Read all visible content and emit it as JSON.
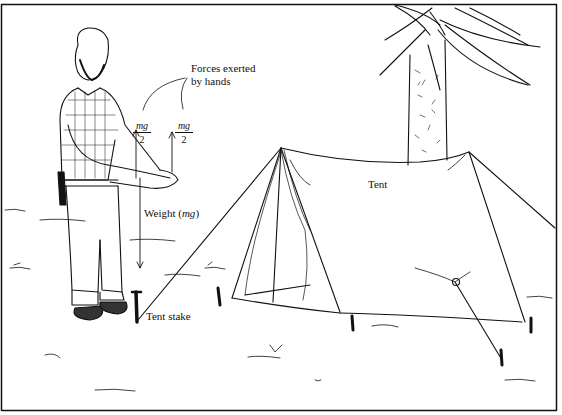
{
  "labels": {
    "forces_line1": "Forces exerted",
    "forces_line2": "by hands",
    "weight_prefix": "Weight (",
    "weight_symbol": "mg",
    "weight_suffix": ")",
    "tent_stake": "Tent stake",
    "tent": "Tent"
  },
  "fractions": [
    {
      "numerator": "mg",
      "denominator": "2"
    },
    {
      "numerator": "mg",
      "denominator": "2"
    }
  ],
  "colors": {
    "ink": "#111111",
    "paper": "#ffffff"
  }
}
